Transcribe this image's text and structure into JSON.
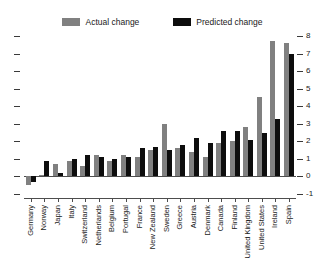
{
  "legend": {
    "entries": [
      {
        "label": "Actual change",
        "color": "#808080",
        "name": "legend-actual-change"
      },
      {
        "label": "Predicted change",
        "color": "#0d0d0d",
        "name": "legend-predicted-change"
      }
    ]
  },
  "axis": {
    "y_ticks": [
      "8",
      "7",
      "6",
      "5",
      "4",
      "3",
      "2",
      "1",
      "0",
      "-1"
    ]
  },
  "chart_data": {
    "type": "bar",
    "title": "",
    "subtitle": "",
    "xlabel": "",
    "ylabel": "",
    "ylim": [
      -1,
      8
    ],
    "ytick_values": [
      -1,
      0,
      1,
      2,
      3,
      4,
      5,
      6,
      7,
      8
    ],
    "grid": false,
    "legend_position": "top-center",
    "orientation": "vertical",
    "grouping": "grouped",
    "categories": [
      "Germany",
      "Norway",
      "Japan",
      "Italy",
      "Switzerland",
      "Netherlands",
      "Belgium",
      "Portugal",
      "France",
      "New Zealand",
      "Sweden",
      "Greece",
      "Austria",
      "Denmark",
      "Canada",
      "Finland",
      "United Kingdom",
      "United States",
      "Ireland",
      "Spain"
    ],
    "series": [
      {
        "name": "Actual change",
        "color": "#808080",
        "values": [
          -0.5,
          0.1,
          0.7,
          0.9,
          0.6,
          1.2,
          0.9,
          1.2,
          1.1,
          1.5,
          3.0,
          1.6,
          1.4,
          1.1,
          1.9,
          2.0,
          2.8,
          4.5,
          7.7,
          7.6
        ]
      },
      {
        "name": "Predicted change",
        "color": "#0d0d0d",
        "values": [
          -0.3,
          0.9,
          0.2,
          1.0,
          1.2,
          1.1,
          1.0,
          1.1,
          1.6,
          1.7,
          1.5,
          1.8,
          2.2,
          1.9,
          2.6,
          2.6,
          2.1,
          2.5,
          3.3,
          7.0
        ]
      }
    ]
  }
}
